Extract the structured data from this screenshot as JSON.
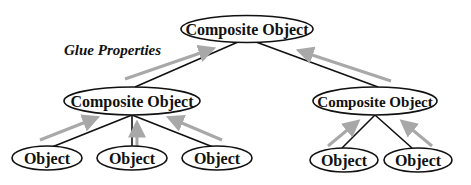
{
  "diagram": {
    "title_label": "Glue Properties",
    "nodes": {
      "root": {
        "label": "Composite Object"
      },
      "left_composite": {
        "label": "Composite Object"
      },
      "right_composite": {
        "label": "Composite Object"
      },
      "left_obj_1": {
        "label": "Object"
      },
      "left_obj_2": {
        "label": "Object"
      },
      "left_obj_3": {
        "label": "Object"
      },
      "right_obj_1": {
        "label": "Object"
      },
      "right_obj_2": {
        "label": "Object"
      }
    },
    "edges": [
      [
        "root",
        "left_composite"
      ],
      [
        "root",
        "right_composite"
      ],
      [
        "left_composite",
        "left_obj_1"
      ],
      [
        "left_composite",
        "left_obj_2"
      ],
      [
        "left_composite",
        "left_obj_3"
      ],
      [
        "right_composite",
        "right_obj_1"
      ],
      [
        "right_composite",
        "right_obj_2"
      ]
    ],
    "colors": {
      "line": "#111111",
      "arrow": "#a8a8a8",
      "background": "#ffffff"
    }
  }
}
